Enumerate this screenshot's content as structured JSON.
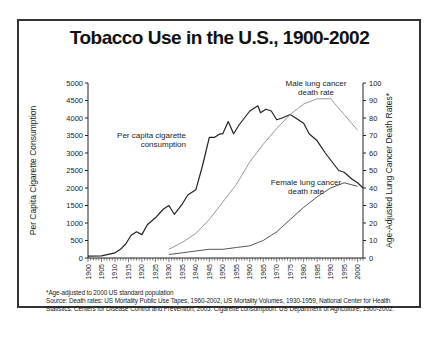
{
  "title": "Tobacco Use in the U.S., 1900-2002",
  "footnote": {
    "line1": "*Age-adjusted to 2000 US standard population",
    "line2": "Source: Death rates: US Mortality Public Use Tapes, 1960-2002, US Mortality Volumes, 1930-1959, National Center for Health",
    "line3": "Statistics. Centers for Disease Control and Prevention, 2005. Cigarette consumption: US Department of Agriculture, 1900-2002."
  },
  "chart_data": {
    "type": "line",
    "title": "Tobacco Use in the U.S., 1900-2002",
    "xlabel": "",
    "ylabel": "Per Capita Cigarette Consumption",
    "y2label": "Age-Adjusted Lung Cancer Death Rates*",
    "xlim": [
      1900,
      2002
    ],
    "ylim": [
      0,
      5000
    ],
    "y2lim": [
      0,
      100
    ],
    "x_ticks": [
      "1900",
      "1905",
      "1910",
      "1915",
      "1920",
      "1925",
      "1930",
      "1935",
      "1940",
      "1945",
      "1950",
      "1955",
      "1960",
      "1965",
      "1970",
      "1975",
      "1980",
      "1985",
      "1990",
      "1995",
      "2000"
    ],
    "y_ticks": [
      0,
      500,
      1000,
      1500,
      2000,
      2500,
      3000,
      3500,
      4000,
      4500,
      5000
    ],
    "y2_ticks": [
      0,
      10,
      20,
      30,
      40,
      50,
      60,
      70,
      80,
      90,
      100
    ],
    "grid": false,
    "series": [
      {
        "name": "Per capita cigarette consumption",
        "axis": "left",
        "color": "#222222",
        "x": [
          1900,
          1905,
          1910,
          1912,
          1914,
          1916,
          1918,
          1920,
          1922,
          1925,
          1928,
          1930,
          1932,
          1935,
          1937,
          1940,
          1942,
          1943,
          1945,
          1947,
          1949,
          1950,
          1952,
          1954,
          1956,
          1958,
          1960,
          1963,
          1964,
          1966,
          1968,
          1970,
          1972,
          1975,
          1978,
          1980,
          1982,
          1985,
          1988,
          1990,
          1993,
          1995,
          1998,
          2000,
          2002
        ],
        "values": [
          54,
          60,
          150,
          250,
          400,
          650,
          750,
          670,
          950,
          1150,
          1400,
          1500,
          1250,
          1550,
          1800,
          1950,
          2500,
          2800,
          3450,
          3450,
          3550,
          3550,
          3900,
          3550,
          3800,
          4000,
          4200,
          4350,
          4150,
          4250,
          4200,
          3950,
          4000,
          4100,
          3950,
          3850,
          3550,
          3350,
          3000,
          2800,
          2500,
          2450,
          2250,
          2150,
          2000
        ]
      },
      {
        "name": "Male lung cancer death rate",
        "axis": "right",
        "color": "#999999",
        "x": [
          1930,
          1935,
          1940,
          1945,
          1950,
          1955,
          1960,
          1965,
          1970,
          1975,
          1980,
          1985,
          1990,
          1995,
          2000
        ],
        "values": [
          5,
          9,
          14,
          22,
          32,
          42,
          55,
          65,
          74,
          82,
          88,
          91,
          91,
          82,
          73
        ]
      },
      {
        "name": "Female lung cancer death rate",
        "axis": "right",
        "color": "#555555",
        "x": [
          1930,
          1935,
          1940,
          1945,
          1950,
          1955,
          1960,
          1965,
          1970,
          1975,
          1980,
          1985,
          1990,
          1995,
          2000
        ],
        "values": [
          2,
          3,
          4,
          5,
          5,
          6,
          7,
          10,
          15,
          22,
          29,
          35,
          40,
          43,
          41
        ]
      }
    ],
    "annotations": [
      {
        "text": "Per capita cigarette consumption",
        "near": "1935, 3000"
      },
      {
        "text": "Male lung cancer death rate",
        "near": "1985, 95"
      },
      {
        "text": "Female lung cancer death rate",
        "near": "1985, 45"
      }
    ]
  }
}
